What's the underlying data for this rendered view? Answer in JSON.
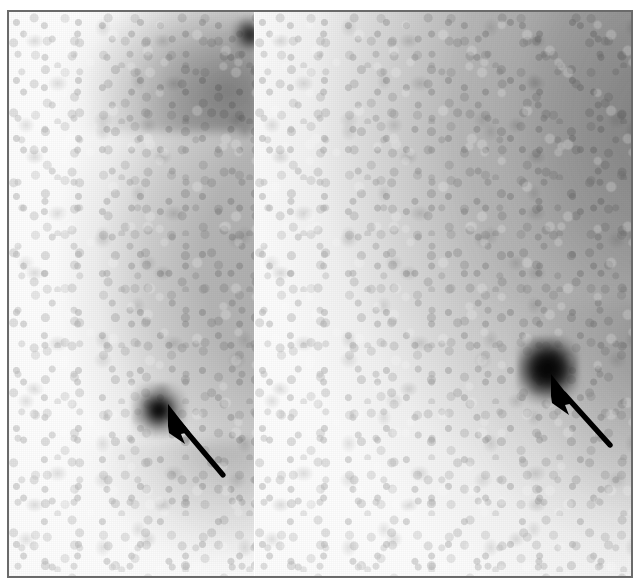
{
  "figure": {
    "modality": "scintimammography",
    "orientation": "lateral / oblique planar views",
    "panel_count": 2,
    "background_color": "#ffffff",
    "frame_color": "#6a6a6a",
    "tissue_gray": "#8a8a8a",
    "lesion_color": "#000000",
    "annotation_color": "#000000"
  },
  "frame": {
    "x": 7,
    "y": 10,
    "width": 626,
    "height": 568,
    "border_width": 2
  },
  "panels": [
    {
      "id": "panel-left",
      "label": "left-breast-view",
      "tissue_shape": "vertical band, soft convex anterior border, hard posterior cut",
      "tissue_left_edge_x": 35,
      "tissue_right_edge_x": 252,
      "superior_band": "increased uptake",
      "lesion": {
        "name": "focal-uptake-lesion",
        "center_x": 150,
        "center_y": 398,
        "diameter_px": 40,
        "intensity": "intense focal uptake"
      },
      "secondary_focus": {
        "name": "superior-focal-uptake",
        "center_x": 240,
        "center_y": 22,
        "diameter_px": 18
      },
      "arrow": {
        "name": "lesion-pointer-arrow",
        "tip_x": 169,
        "tip_y": 412,
        "tail_x": 221,
        "tail_y": 473,
        "direction": "up-left"
      }
    },
    {
      "id": "panel-right",
      "label": "right-breast-view",
      "tissue_shape": "convex curved contour, dense superior-posterior, fading antero-inferiorly",
      "tissue_left_edge_x": 410,
      "lesion": {
        "name": "focal-uptake-lesion",
        "center_x": 535,
        "center_y": 358,
        "diameter_px": 46,
        "intensity": "intense focal uptake"
      },
      "arrow": {
        "name": "lesion-pointer-arrow",
        "tip_x": 557,
        "tip_y": 383,
        "tail_x": 608,
        "tail_y": 443,
        "direction": "up-left"
      }
    }
  ]
}
